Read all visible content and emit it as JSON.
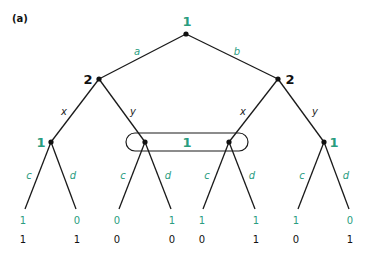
{
  "panel_label": "(a)",
  "colors": {
    "player1": "#2a9d7f",
    "player2": "#111111"
  },
  "nodes": {
    "root": {
      "player": "1"
    },
    "left_p2": {
      "player": "2"
    },
    "right_p2": {
      "player": "2"
    },
    "ll_p1": {
      "player": "1"
    },
    "info_set": {
      "player": "1"
    },
    "rr_p1": {
      "player": "1"
    }
  },
  "actions": {
    "root": [
      "a",
      "b"
    ],
    "left_p2": [
      "x",
      "y"
    ],
    "right_p2": [
      "x",
      "y"
    ],
    "ll_p1": [
      "c",
      "d"
    ],
    "info_left": [
      "c",
      "d"
    ],
    "info_right": [
      "c",
      "d"
    ],
    "rr_p1": [
      "c",
      "d"
    ]
  },
  "payoffs": [
    {
      "p1": "1",
      "p2": "1"
    },
    {
      "p1": "0",
      "p2": "1"
    },
    {
      "p1": "0",
      "p2": "0"
    },
    {
      "p1": "1",
      "p2": "0"
    },
    {
      "p1": "1",
      "p2": "0"
    },
    {
      "p1": "1",
      "p2": "1"
    },
    {
      "p1": "1",
      "p2": "0"
    },
    {
      "p1": "0",
      "p2": "1"
    }
  ]
}
